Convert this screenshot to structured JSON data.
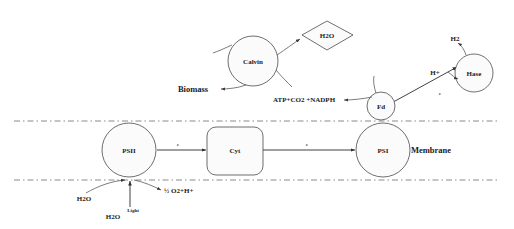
{
  "diagram": {
    "background_color": "#ffffff",
    "stroke_color": "#2b2b2b",
    "shape_fill": "#fbfbfb",
    "membrane_color": "#8a8a8a"
  },
  "nodes": {
    "psii": {
      "label": "PSII",
      "shape": "circle"
    },
    "cyt": {
      "label": "Cyt",
      "shape": "rounded-rect"
    },
    "psi": {
      "label": "PSI",
      "shape": "circle"
    },
    "fd": {
      "label": "Fd",
      "shape": "circle"
    },
    "hase": {
      "label": "Hase",
      "shape": "circle"
    },
    "calvin": {
      "label": "Calvin",
      "shape": "circle"
    },
    "h2o_product": {
      "label": "H2O",
      "shape": "diamond"
    }
  },
  "labels": {
    "membrane": "Membrane",
    "biomass": "Biomass",
    "atp_co2_nadph": "ATP+CO2 +NADPH",
    "h2o_left": "H2O",
    "h2o_bottom": "H2O",
    "light": "Light",
    "oxygen_proton": "½ O2+H+",
    "h_plus": "H+",
    "h2": "H2",
    "electron_psii_cyt": "e",
    "electron_cyt_psi": "e",
    "electron_fd_hase": "e"
  }
}
